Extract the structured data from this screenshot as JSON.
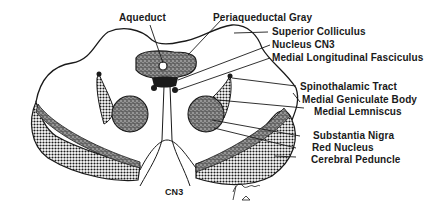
{
  "diagram": {
    "labels": {
      "aqueduct": "Aqueduct",
      "periaqueductal_gray": "Periaqueductal Gray",
      "superior_colliculus": "Superior Colliculus",
      "nucleus_cn3": "Nucleus CN3",
      "mlf": "Medial Longitudinal Fasciculus",
      "spinothalamic_tract": "Spinothalamic Tract",
      "medial_geniculate_body": "Medial Geniculate Body",
      "medial_lemniscus": "Medial Lemniscus",
      "substantia_nigra": "Substantia Nigra",
      "red_nucleus": "Red Nucleus",
      "cerebral_peduncle": "Cerebral Peduncle",
      "cn3": "CN3"
    },
    "signature": "artist signature (handwritten)",
    "colors": {
      "ink": "#1a1a1a",
      "background": "#ffffff"
    }
  }
}
